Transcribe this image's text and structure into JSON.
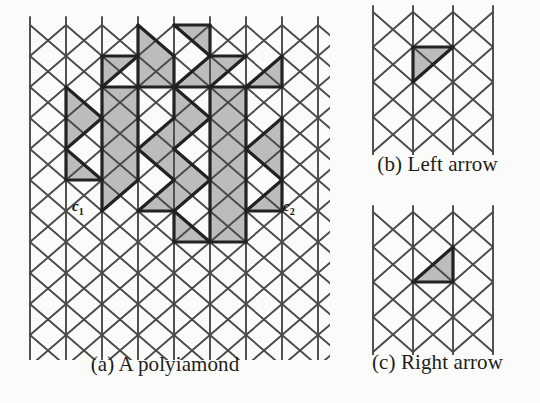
{
  "figure": {
    "background_color": "#fbfbfa",
    "line_color": "#4a4a4a",
    "bold_line_color": "#222222",
    "shade_color": "#bcbcbc",
    "text_color": "#1d1d1d"
  },
  "panels": {
    "a": {
      "caption": "(a) A polyiamond",
      "labels": {
        "c1": {
          "base": "c",
          "sub": "1"
        },
        "c2": {
          "base": "c",
          "sub": "2"
        }
      },
      "grid": {
        "columns": 9,
        "rows": 11,
        "cell_width": 36,
        "row_height": 31,
        "origin_x": 30,
        "origin_y": 25
      },
      "shaded_cells": [
        {
          "row": 0,
          "col": 3,
          "dir": "right"
        },
        {
          "row": 0,
          "col": 4,
          "dir": "left"
        },
        {
          "row": 1,
          "col": 2,
          "dir": "right"
        },
        {
          "row": 1,
          "col": 3,
          "dir": "left"
        },
        {
          "row": 1,
          "col": 3,
          "dir": "right"
        },
        {
          "row": 1,
          "col": 4,
          "dir": "left"
        },
        {
          "row": 1,
          "col": 5,
          "dir": "right"
        },
        {
          "row": 1,
          "col": 6,
          "dir": "left"
        },
        {
          "row": 2,
          "col": 1,
          "dir": "right"
        },
        {
          "row": 2,
          "col": 2,
          "dir": "left"
        },
        {
          "row": 2,
          "col": 2,
          "dir": "right"
        },
        {
          "row": 2,
          "col": 4,
          "dir": "right"
        },
        {
          "row": 2,
          "col": 5,
          "dir": "left"
        },
        {
          "row": 2,
          "col": 5,
          "dir": "right"
        },
        {
          "row": 3,
          "col": 1,
          "dir": "right"
        },
        {
          "row": 3,
          "col": 2,
          "dir": "left"
        },
        {
          "row": 3,
          "col": 2,
          "dir": "right"
        },
        {
          "row": 3,
          "col": 3,
          "dir": "left"
        },
        {
          "row": 3,
          "col": 4,
          "dir": "right"
        },
        {
          "row": 3,
          "col": 5,
          "dir": "left"
        },
        {
          "row": 3,
          "col": 5,
          "dir": "right"
        },
        {
          "row": 3,
          "col": 6,
          "dir": "left"
        },
        {
          "row": 4,
          "col": 1,
          "dir": "right"
        },
        {
          "row": 4,
          "col": 2,
          "dir": "left"
        },
        {
          "row": 4,
          "col": 2,
          "dir": "right"
        },
        {
          "row": 4,
          "col": 3,
          "dir": "left"
        },
        {
          "row": 4,
          "col": 4,
          "dir": "right"
        },
        {
          "row": 4,
          "col": 5,
          "dir": "left"
        },
        {
          "row": 4,
          "col": 5,
          "dir": "right"
        },
        {
          "row": 4,
          "col": 6,
          "dir": "left"
        },
        {
          "row": 5,
          "col": 2,
          "dir": "right"
        },
        {
          "row": 5,
          "col": 3,
          "dir": "left"
        },
        {
          "row": 5,
          "col": 4,
          "dir": "right"
        },
        {
          "row": 5,
          "col": 5,
          "dir": "left"
        },
        {
          "row": 5,
          "col": 5,
          "dir": "right"
        },
        {
          "row": 5,
          "col": 6,
          "dir": "left"
        },
        {
          "row": 6,
          "col": 4,
          "dir": "right"
        },
        {
          "row": 6,
          "col": 5,
          "dir": "left"
        },
        {
          "row": 6,
          "col": 5,
          "dir": "right"
        }
      ]
    },
    "b": {
      "caption": "(b) Left arrow",
      "grid": {
        "columns": 3,
        "rows": 4,
        "cell_width": 40,
        "row_height": 35,
        "origin_x": 38,
        "origin_y": 12
      },
      "shaded_cells": [
        {
          "row": 1,
          "col": 1,
          "dir": "right"
        }
      ],
      "highlight_edge": {
        "row": 1,
        "col": 1,
        "side": "right"
      }
    },
    "c": {
      "caption": "(c) Right arrow",
      "grid": {
        "columns": 3,
        "rows": 4,
        "cell_width": 40,
        "row_height": 35,
        "origin_x": 38,
        "origin_y": 12
      },
      "shaded_cells": [
        {
          "row": 1,
          "col": 1,
          "dir": "left"
        }
      ],
      "highlight_edge": {
        "row": 1,
        "col": 1,
        "side": "left"
      }
    }
  }
}
